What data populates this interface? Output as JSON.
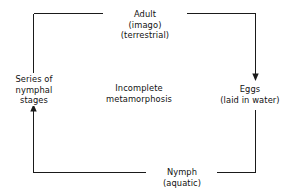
{
  "diagram": {
    "title": "Incomplete metamorphosis",
    "type": "cycle-diagram",
    "center_label": {
      "line1": "Incomplete",
      "line2": "metamorphosis"
    },
    "stroke_color": "#1a1a1a",
    "text_color": "#111111",
    "background_color": "#ffffff",
    "nodes": [
      {
        "id": "adult",
        "position": "top",
        "line1": "Adult",
        "line2": "(imago)",
        "line3": "(terrestrial)"
      },
      {
        "id": "eggs",
        "position": "right",
        "line1": "Eggs",
        "line2": "(laid in water)",
        "line3": ""
      },
      {
        "id": "nymph",
        "position": "bottom",
        "line1": "Nymph",
        "line2": "(aquatic)",
        "line3": ""
      },
      {
        "id": "series-of-nymphal-stages",
        "position": "left",
        "line1": "Series of",
        "line2": "nymphal",
        "line3": "stages"
      }
    ],
    "arrows": [
      {
        "id": "series-to-adult",
        "from": "series-of-nymphal-stages",
        "to": "adult",
        "direction": "right"
      },
      {
        "id": "adult-to-eggs",
        "from": "adult",
        "to": "eggs",
        "direction": "down"
      },
      {
        "id": "eggs-to-nymph",
        "from": "eggs",
        "to": "nymph",
        "direction": "left"
      },
      {
        "id": "nymph-to-series",
        "from": "nymph",
        "to": "series-of-nymphal-stages",
        "direction": "up"
      }
    ]
  }
}
